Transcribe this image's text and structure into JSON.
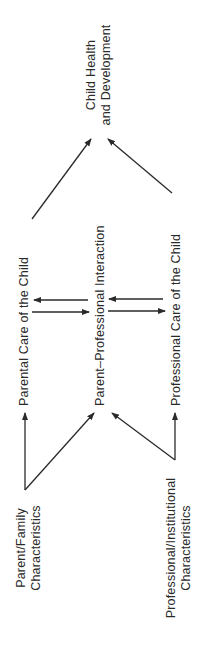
{
  "diagram": {
    "nodes": {
      "outcome": {
        "line1": "Child Health",
        "line2": "and Development"
      },
      "parental_care": "Parental Care of the Child",
      "interaction": "Parent–Professional Interaction",
      "professional_care": "Professional Care of the Child",
      "parent_family": {
        "line1": "Parent/Family",
        "line2": "Characteristics"
      },
      "professional_institutional": {
        "line1": "Professional/Institutional",
        "line2": "Characteristics"
      }
    },
    "edges": [
      {
        "from": "Parent/Family Characteristics",
        "to": "Parental Care of the Child"
      },
      {
        "from": "Parent/Family Characteristics",
        "to": "Parent–Professional Interaction"
      },
      {
        "from": "Professional/Institutional Characteristics",
        "to": "Professional Care of the Child"
      },
      {
        "from": "Professional/Institutional Characteristics",
        "to": "Parent–Professional Interaction"
      },
      {
        "from": "Parental Care of the Child",
        "to": "Parent–Professional Interaction"
      },
      {
        "from": "Parent–Professional Interaction",
        "to": "Parental Care of the Child"
      },
      {
        "from": "Professional Care of the Child",
        "to": "Parent–Professional Interaction"
      },
      {
        "from": "Parent–Professional Interaction",
        "to": "Professional Care of the Child"
      },
      {
        "from": "Parental Care of the Child",
        "to": "Child Health and Development"
      },
      {
        "from": "Professional Care of the Child",
        "to": "Child Health and Development"
      }
    ],
    "orientation": "rotated 90° counter-clockwise",
    "line_color": "#2a2a2a"
  }
}
